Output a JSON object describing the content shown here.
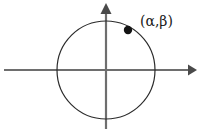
{
  "figure": {
    "type": "unit-circle-diagram",
    "width": 201,
    "height": 135,
    "background_color": "#ffffff"
  },
  "axes": {
    "x_axis": {
      "name": "horizontal-axis",
      "y": 70,
      "x_start": 4,
      "x_end": 196,
      "color": "#6e6e6e",
      "arrowhead": "right"
    },
    "y_axis": {
      "name": "vertical-axis",
      "x": 106,
      "y_start": 4,
      "y_end": 129,
      "color": "#6e6e6e",
      "arrowhead": "up"
    }
  },
  "circle": {
    "name": "unit-circle",
    "center_x": 106,
    "center_y": 70,
    "radius": 49,
    "stroke_color": "#2b2b2b",
    "stroke_width": 1.2,
    "fill": "none"
  },
  "point": {
    "name": "point-on-circle",
    "x": 128,
    "y": 30,
    "radius": 4.2,
    "color": "#141414"
  },
  "label": {
    "text": "(α,β)",
    "alpha": "α",
    "beta": "β",
    "x": 140,
    "y": 14,
    "color": "#1a1a1a"
  }
}
